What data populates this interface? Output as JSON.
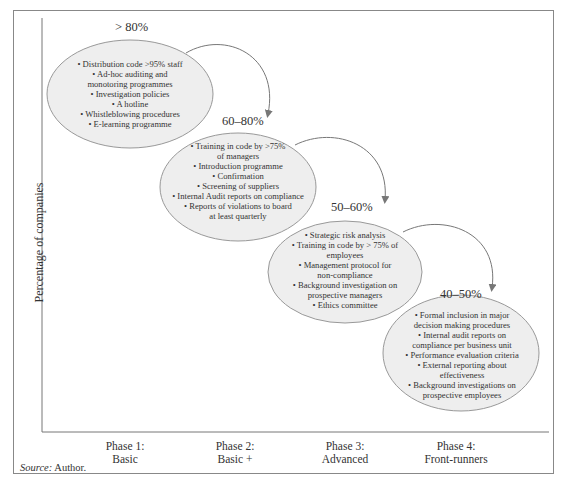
{
  "figure": {
    "y_axis_label": "Percentage of companies",
    "source_label": "Source:",
    "source_value": " Author.",
    "colors": {
      "frame": "#888888",
      "bubble_fill": "#eeeeee",
      "bubble_stroke": "#999999",
      "arrow": "#777777",
      "text": "#333333"
    }
  },
  "phases": [
    {
      "pct": "> 80%",
      "line1": "Phase 1:",
      "line2": "Basic",
      "items": [
        "• Distribution code >95% staff",
        "• Ad-hoc auditing and",
        "monotoring programmes",
        "• Investigation policies",
        "• A hotline",
        "• Whistleblowing procedures",
        "• E-learning programme"
      ]
    },
    {
      "pct": "60–80%",
      "line1": "Phase 2:",
      "line2": "Basic +",
      "items": [
        "• Training in code by >75%",
        "of managers",
        "• Introduction programme",
        "• Confirmation",
        "• Screening of suppliers",
        "• Internal Audit reports on compliance",
        "• Reports of violations to board",
        "at least quarterly"
      ]
    },
    {
      "pct": "50–60%",
      "line1": "Phase 3:",
      "line2": "Advanced",
      "items": [
        "• Strategic risk analysis",
        "• Training in code by > 75% of",
        "employees",
        "• Management protocol for",
        "non-compliance",
        "• Background investigation on",
        "prospective managers",
        "• Ethics committee"
      ]
    },
    {
      "pct": "40–50%",
      "line1": "Phase 4:",
      "line2": "Front-runners",
      "items": [
        "• Formal inclusion in major",
        "decision making procedures",
        "• Internal audit reports on",
        "compliance per business unit",
        "• Performance evaluation criteria",
        "• External reporting about",
        "effectiveness",
        "• Background investigations on",
        "prospective employees"
      ]
    }
  ]
}
